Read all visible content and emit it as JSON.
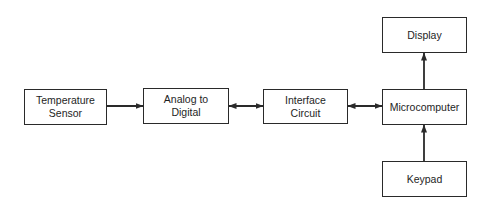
{
  "diagram": {
    "type": "block-diagram",
    "colors": {
      "line": "#2a2a2a",
      "text": "#1e1e1e",
      "background": "#ffffff"
    },
    "nodes": {
      "temperature_sensor": {
        "label": "Temperature\nSensor"
      },
      "analog_to_digital": {
        "label": "Analog to\nDigital"
      },
      "interface_circuit": {
        "label": "Interface\nCircuit"
      },
      "microcomputer": {
        "label": "Microcomputer"
      },
      "display": {
        "label": "Display"
      },
      "keypad": {
        "label": "Keypad"
      }
    },
    "edges": [
      {
        "from": "temperature_sensor",
        "to": "analog_to_digital",
        "direction": "forward"
      },
      {
        "from": "analog_to_digital",
        "to": "interface_circuit",
        "direction": "bidirectional"
      },
      {
        "from": "interface_circuit",
        "to": "microcomputer",
        "direction": "bidirectional"
      },
      {
        "from": "microcomputer",
        "to": "display",
        "direction": "forward"
      },
      {
        "from": "keypad",
        "to": "microcomputer",
        "direction": "forward"
      }
    ]
  }
}
